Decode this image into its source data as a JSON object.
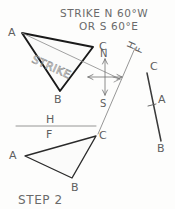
{
  "figure": {
    "caption": "STEP 2",
    "annotations": {
      "strike_line_1": "STRIKE  N 60°W",
      "strike_line_2": "OR  S 60°E",
      "strike_label": "STRIKE"
    },
    "fold_lines": {
      "horizontal": {
        "upper_label": "H",
        "lower_label": "F"
      },
      "diagonal": {
        "upper_label": "H",
        "lower_label": "F"
      }
    },
    "compass": {
      "north_label": "N",
      "south_label": "S"
    },
    "top_view_triangle": {
      "name": "top-view-triangle",
      "vertices": [
        {
          "label": "A",
          "x": 22,
          "y": 33
        },
        {
          "label": "C",
          "x": 93,
          "y": 47
        },
        {
          "label": "B",
          "x": 60,
          "y": 91
        }
      ]
    },
    "front_view_triangle": {
      "name": "front-view-triangle",
      "vertices": [
        {
          "label": "A",
          "x": 25,
          "y": 156
        },
        {
          "label": "C",
          "x": 96,
          "y": 136
        },
        {
          "label": "B",
          "x": 72,
          "y": 178
        }
      ]
    },
    "auxiliary_edge_view": {
      "name": "auxiliary-edge-view",
      "points": [
        {
          "label": "C",
          "x": 147,
          "y": 73
        },
        {
          "label": "A",
          "x": 153,
          "y": 105
        },
        {
          "label": "B",
          "x": 161,
          "y": 141
        }
      ]
    },
    "colors": {
      "ink_dark": "#1a1a1a",
      "ink_mid": "#5f5f5f",
      "ink_light": "#909090",
      "paper": "#fdfdfc"
    }
  }
}
